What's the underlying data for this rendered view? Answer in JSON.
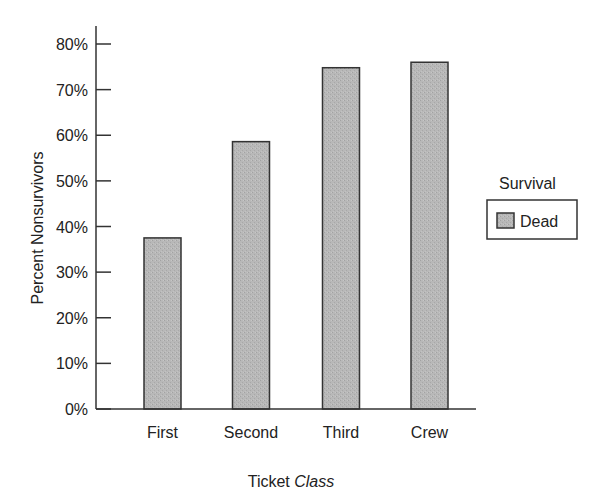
{
  "chart_data": {
    "type": "bar",
    "title": "",
    "xlabel": "Ticket Class",
    "xlabel_parts": {
      "regular": "Ticket ",
      "italic": "Class"
    },
    "ylabel": "Percent Nonsurvivors",
    "categories": [
      "First",
      "Second",
      "Third",
      "Crew"
    ],
    "series": [
      {
        "name": "Dead",
        "values": [
          37.5,
          58.6,
          74.8,
          76.0
        ],
        "color": "#b3b3b3"
      }
    ],
    "ylim": [
      0,
      80
    ],
    "yticks": [
      "0%",
      "10%",
      "20%",
      "30%",
      "40%",
      "50%",
      "60%",
      "70%",
      "80%"
    ],
    "grid": false,
    "legend": {
      "title": "Survival",
      "position": "right",
      "entries": [
        "Dead"
      ]
    }
  },
  "colors": {
    "bar_fill": "#b3b3b3",
    "bar_stroke": "#333333",
    "axis": "#333333"
  }
}
